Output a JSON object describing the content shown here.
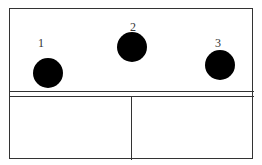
{
  "diagram": {
    "balls": [
      {
        "label": "1",
        "cx": 48,
        "cy": 73,
        "r": 15,
        "label_x": 38,
        "label_y": 37
      },
      {
        "label": "2",
        "cx": 132,
        "cy": 47,
        "r": 15,
        "label_x": 130,
        "label_y": 21
      },
      {
        "label": "3",
        "cx": 220,
        "cy": 65,
        "r": 15,
        "label_x": 215,
        "label_y": 37
      }
    ],
    "frame": {
      "left": 9,
      "top": 8,
      "right": 254,
      "bottom": 160
    },
    "shelf_lines_y": [
      91,
      96
    ],
    "divider_x": 131,
    "colors": {
      "ball": "#000000",
      "line": "#333333",
      "background": "#ffffff"
    }
  }
}
